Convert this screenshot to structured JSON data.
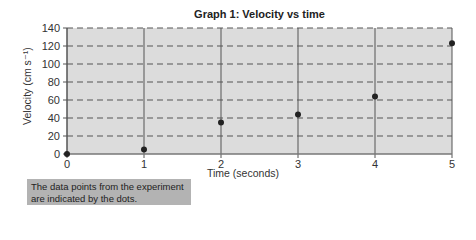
{
  "chart_data": {
    "type": "scatter",
    "title": "Graph 1:  Velocity vs time",
    "xlabel": "Time (seconds)",
    "ylabel": "Velocity (cm s⁻¹)",
    "x": [
      0,
      1,
      2,
      3,
      4,
      5
    ],
    "y": [
      0,
      5,
      35,
      44,
      64,
      123
    ],
    "xlim": [
      0,
      5
    ],
    "ylim": [
      0,
      140
    ],
    "x_ticks": [
      "0",
      "1",
      "2",
      "3",
      "4",
      "5"
    ],
    "y_ticks": [
      "0",
      "20",
      "40",
      "60",
      "80",
      "100",
      "120",
      "140"
    ],
    "grid": {
      "horizontal": "dashed",
      "vertical": "solid"
    },
    "marker": "dot",
    "annotation": "The data points from the experiment are indicated by the dots."
  },
  "colors": {
    "plot_background": "#dcdcdc",
    "grid_line": "#555555",
    "marker": "#222222",
    "note_background": "#b3b3b3"
  },
  "note": {
    "line1": "The data points from the experiment",
    "line2": "are indicated by the dots."
  }
}
